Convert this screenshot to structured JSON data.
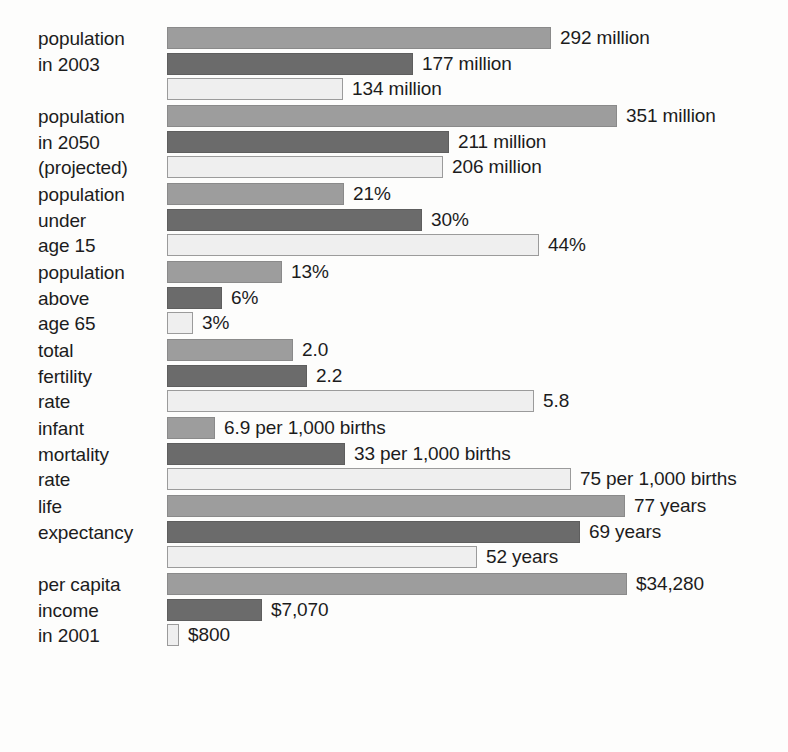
{
  "chart_data": {
    "type": "bar",
    "orientation": "horizontal",
    "title": "",
    "subtitle": "",
    "xlabel": "",
    "ylabel": "",
    "grid": false,
    "legend_position": "none",
    "legend": [],
    "series": [
      {
        "name": "series-1-light-gray",
        "color": "#9d9d9d"
      },
      {
        "name": "series-2-dark-gray",
        "color": "#6b6b6b"
      },
      {
        "name": "series-3-white",
        "color": "#efefef"
      }
    ],
    "categories": [
      "population in 2003",
      "population in 2050 (projected)",
      "population under age 15",
      "population above age 65",
      "total fertility rate",
      "infant mortality rate",
      "life expectancy",
      "per capita income in 2001"
    ],
    "groups": [
      {
        "label_lines": [
          "population",
          "in 2003"
        ],
        "unit": "million",
        "bars": [
          {
            "value": 292,
            "label": "292 million",
            "bar_px": 384
          },
          {
            "value": 177,
            "label": "177 million",
            "bar_px": 246
          },
          {
            "value": 134,
            "label": "134 million",
            "bar_px": 176
          }
        ]
      },
      {
        "label_lines": [
          "population",
          "in 2050",
          "(projected)"
        ],
        "unit": "million",
        "bars": [
          {
            "value": 351,
            "label": "351 million",
            "bar_px": 450
          },
          {
            "value": 211,
            "label": "211 million",
            "bar_px": 282
          },
          {
            "value": 206,
            "label": "206 million",
            "bar_px": 276
          }
        ]
      },
      {
        "label_lines": [
          "population",
          "under",
          "age 15"
        ],
        "unit": "%",
        "bars": [
          {
            "value": 21,
            "label": "21%",
            "bar_px": 177
          },
          {
            "value": 30,
            "label": "30%",
            "bar_px": 255
          },
          {
            "value": 44,
            "label": "44%",
            "bar_px": 372
          }
        ]
      },
      {
        "label_lines": [
          "population",
          "above",
          "age 65"
        ],
        "unit": "%",
        "bars": [
          {
            "value": 13,
            "label": "13%",
            "bar_px": 115
          },
          {
            "value": 6,
            "label": "6%",
            "bar_px": 55
          },
          {
            "value": 3,
            "label": "3%",
            "bar_px": 26
          }
        ]
      },
      {
        "label_lines": [
          "total",
          "fertility",
          "rate"
        ],
        "unit": "",
        "bars": [
          {
            "value": 2.0,
            "label": "2.0",
            "bar_px": 126
          },
          {
            "value": 2.2,
            "label": "2.2",
            "bar_px": 140
          },
          {
            "value": 5.8,
            "label": "5.8",
            "bar_px": 367
          }
        ]
      },
      {
        "label_lines": [
          "infant",
          "mortality",
          "rate"
        ],
        "unit": "per 1,000 births",
        "bars": [
          {
            "value": 6.9,
            "label": "6.9 per 1,000 births",
            "bar_px": 48
          },
          {
            "value": 33,
            "label": "33 per 1,000 births",
            "bar_px": 178
          },
          {
            "value": 75,
            "label": "75 per 1,000 births",
            "bar_px": 404
          }
        ]
      },
      {
        "label_lines": [
          "life",
          "expectancy"
        ],
        "unit": "years",
        "bars": [
          {
            "value": 77,
            "label": "77 years",
            "bar_px": 458
          },
          {
            "value": 69,
            "label": "69 years",
            "bar_px": 413
          },
          {
            "value": 52,
            "label": "52 years",
            "bar_px": 310
          }
        ]
      },
      {
        "label_lines": [
          "per capita",
          "income",
          "in 2001"
        ],
        "unit": "$",
        "bars": [
          {
            "value": 34280,
            "label": "$34,280",
            "bar_px": 460
          },
          {
            "value": 7070,
            "label": "$7,070",
            "bar_px": 95
          },
          {
            "value": 800,
            "label": "$800",
            "bar_px": 12
          }
        ]
      }
    ]
  }
}
